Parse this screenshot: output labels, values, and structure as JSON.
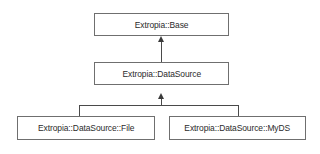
{
  "diagram": {
    "type": "uml-class-inheritance",
    "background_color": "#ffffff",
    "line_color": "#4a4a4a",
    "box_border_color": "#6f6f6f",
    "text_color": "#2b2b2b",
    "nodes": [
      {
        "id": "base",
        "label": "Extropia::Base",
        "x": 94,
        "y": 13,
        "width": 135,
        "height": 23
      },
      {
        "id": "datasource",
        "label": "Extropia::DataSource",
        "x": 94,
        "y": 62,
        "width": 135,
        "height": 23
      },
      {
        "id": "file",
        "label": "Extropia::DataSource::File",
        "x": 17,
        "y": 116,
        "width": 138,
        "height": 24
      },
      {
        "id": "myds",
        "label": "Extropia::DataSource::MyDS",
        "x": 169,
        "y": 116,
        "width": 137,
        "height": 24
      }
    ],
    "edges": [
      {
        "id": "datasource-to-base",
        "from": "datasource",
        "to": "base",
        "relation": "inherits",
        "arrow": "up"
      },
      {
        "id": "file-to-datasource",
        "from": "file",
        "to": "datasource",
        "relation": "inherits",
        "arrow": "up"
      },
      {
        "id": "myds-to-datasource",
        "from": "myds",
        "to": "datasource",
        "relation": "inherits",
        "arrow": "up"
      }
    ]
  }
}
